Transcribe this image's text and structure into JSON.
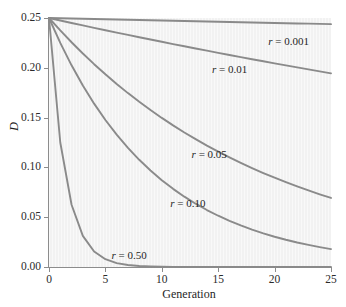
{
  "figure": {
    "background_color": "#ffffff",
    "plot_background_color": "#f2f2f2",
    "axis_color": "#8c8c8c",
    "curve_color": "#8a8a8a"
  },
  "chart_data": {
    "type": "line",
    "title": "",
    "xlabel": "Generation",
    "ylabel": "D",
    "xlim": [
      0,
      25
    ],
    "ylim": [
      0,
      0.25
    ],
    "grid": false,
    "legend_position": "inline-annotations",
    "x_ticks": [
      "0",
      "5",
      "10",
      "15",
      "20",
      "25"
    ],
    "x_tick_values": [
      0,
      5,
      10,
      15,
      20,
      25
    ],
    "y_ticks": [
      "0.00",
      "0.05",
      "0.10",
      "0.15",
      "0.20",
      "0.25"
    ],
    "y_tick_values": [
      0.0,
      0.05,
      0.1,
      0.15,
      0.2,
      0.25
    ],
    "initial_D": 0.25,
    "x": [
      0,
      1,
      2,
      3,
      4,
      5,
      6,
      7,
      8,
      9,
      10,
      11,
      12,
      13,
      14,
      15,
      16,
      17,
      18,
      19,
      20,
      21,
      22,
      23,
      24,
      25
    ],
    "series": [
      {
        "name": "r = 0.001",
        "r": 0.001,
        "label_text_prefix": "r",
        "label_text_suffix": " = 0.001",
        "values": [
          0.25,
          0.24975,
          0.2495,
          0.24925,
          0.249,
          0.24875,
          0.2485,
          0.24826,
          0.24801,
          0.24776,
          0.24751,
          0.24726,
          0.24701,
          0.24677,
          0.24652,
          0.24627,
          0.24603,
          0.24578,
          0.24553,
          0.24529,
          0.24504,
          0.2448,
          0.24455,
          0.24431,
          0.24406,
          0.24382
        ]
      },
      {
        "name": "r = 0.01",
        "r": 0.01,
        "label_text_prefix": "r",
        "label_text_suffix": " = 0.01",
        "values": [
          0.25,
          0.2475,
          0.24503,
          0.24258,
          0.24015,
          0.23775,
          0.23537,
          0.23302,
          0.23069,
          0.22838,
          0.2261,
          0.22384,
          0.2216,
          0.21938,
          0.21719,
          0.21502,
          0.21287,
          0.21074,
          0.20863,
          0.20654,
          0.20448,
          0.20243,
          0.20041,
          0.1984,
          0.19642,
          0.19446
        ]
      },
      {
        "name": "r = 0.05",
        "r": 0.05,
        "label_text_prefix": "r",
        "label_text_suffix": " = 0.05",
        "values": [
          0.25,
          0.2375,
          0.22563,
          0.21434,
          0.20363,
          0.19345,
          0.18377,
          0.17458,
          0.16586,
          0.15756,
          0.14969,
          0.1422,
          0.13509,
          0.12834,
          0.12192,
          0.11583,
          0.11004,
          0.10453,
          0.09931,
          0.09434,
          0.08962,
          0.08514,
          0.08089,
          0.07684,
          0.073,
          0.06935
        ]
      },
      {
        "name": "r = 0.10",
        "r": 0.1,
        "label_text_prefix": "r",
        "label_text_suffix": " = 0.10",
        "values": [
          0.25,
          0.225,
          0.2025,
          0.18225,
          0.16403,
          0.14762,
          0.13286,
          0.11957,
          0.10762,
          0.09685,
          0.08717,
          0.07845,
          0.07061,
          0.06355,
          0.05719,
          0.05147,
          0.04633,
          0.04169,
          0.03752,
          0.03377,
          0.03039,
          0.02735,
          0.02462,
          0.02216,
          0.01994,
          0.01795
        ]
      },
      {
        "name": "r = 0.50",
        "r": 0.5,
        "label_text_prefix": "r",
        "label_text_suffix": " = 0.50",
        "values": [
          0.25,
          0.125,
          0.0625,
          0.03125,
          0.015625,
          0.0078125,
          0.00390625,
          0.001953125,
          0.0009765625,
          0.00048828,
          0.00024414,
          0.00012207,
          6.104e-05,
          3.052e-05,
          1.526e-05,
          7.63e-06,
          3.81e-06,
          1.91e-06,
          9.5e-07,
          4.8e-07,
          2.4e-07,
          1.2e-07,
          6e-08,
          3e-08,
          1e-08,
          0.0
        ]
      }
    ]
  }
}
